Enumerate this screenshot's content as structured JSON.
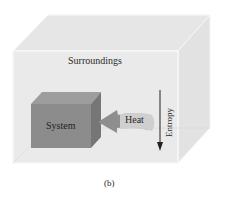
{
  "diagram": {
    "surroundings_label": "Surroundings",
    "system_label": "System",
    "heat_label": "Heat",
    "entropy_label": "Entropy",
    "caption": "(b)"
  },
  "colors": {
    "box_face": "#e9e9e9",
    "box_edge": "#f7f7f7",
    "system_front": "#8c8c8c",
    "system_top": "#9d9d9d",
    "system_side": "#7a7a7a",
    "heat_arrow": "#8a8a8a",
    "entropy_arrow": "#222222"
  }
}
